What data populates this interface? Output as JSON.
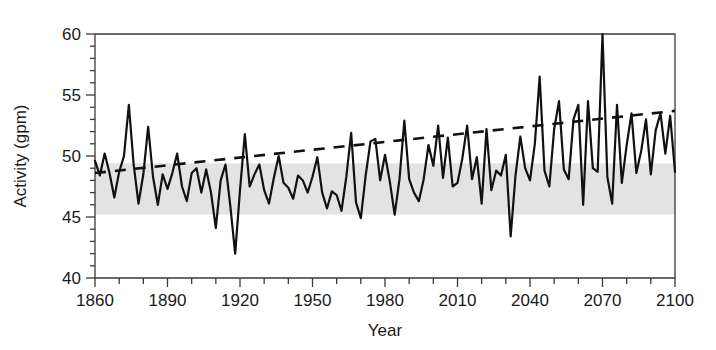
{
  "chart_data": {
    "type": "line",
    "title": "",
    "xlabel": "Year",
    "ylabel": "Activity (gpm)",
    "xlim": [
      1860,
      2100
    ],
    "ylim": [
      40,
      60
    ],
    "xticks": [
      1860,
      1890,
      1920,
      1950,
      1980,
      2010,
      2040,
      2070,
      2100
    ],
    "xtick_labels": [
      "1860",
      "1890",
      "1920",
      "1950",
      "1980",
      "2010",
      "2040",
      "2070",
      "2100"
    ],
    "xminor_step": 10,
    "yticks": [
      40,
      45,
      50,
      55,
      60
    ],
    "ytick_labels": [
      "40",
      "45",
      "50",
      "55",
      "60"
    ],
    "yminor_step": 1,
    "grid": false,
    "legend": "none",
    "line_color": "#111111",
    "band_color": "#e3e3e3",
    "trend_color": "#111111",
    "shaded_band": {
      "label": "reference envelope",
      "ymin": 45.2,
      "ymax": 49.4,
      "xmin": 1860,
      "xmax": 2100
    },
    "trend_line": {
      "label": "linear trend (dashed)",
      "style": "dashed",
      "x": [
        1860,
        2100
      ],
      "y": [
        48.6,
        53.7
      ]
    },
    "series": [
      {
        "name": "Activity",
        "x": [
          1860,
          1862,
          1864,
          1866,
          1868,
          1870,
          1872,
          1874,
          1876,
          1878,
          1880,
          1882,
          1884,
          1886,
          1888,
          1890,
          1892,
          1894,
          1896,
          1898,
          1900,
          1902,
          1904,
          1906,
          1908,
          1910,
          1912,
          1914,
          1916,
          1918,
          1920,
          1922,
          1924,
          1926,
          1928,
          1930,
          1932,
          1934,
          1936,
          1938,
          1940,
          1942,
          1944,
          1946,
          1948,
          1950,
          1952,
          1954,
          1956,
          1958,
          1960,
          1962,
          1964,
          1966,
          1968,
          1970,
          1972,
          1974,
          1976,
          1978,
          1980,
          1982,
          1984,
          1986,
          1988,
          1990,
          1992,
          1994,
          1996,
          1998,
          2000,
          2002,
          2004,
          2006,
          2008,
          2010,
          2012,
          2014,
          2016,
          2018,
          2020,
          2022,
          2024,
          2026,
          2028,
          2030,
          2032,
          2034,
          2036,
          2038,
          2040,
          2042,
          2044,
          2046,
          2048,
          2050,
          2052,
          2054,
          2056,
          2058,
          2060,
          2062,
          2064,
          2066,
          2068,
          2070,
          2072,
          2074,
          2076,
          2078,
          2080,
          2082,
          2084,
          2086,
          2088,
          2090,
          2092,
          2094,
          2096,
          2098,
          2100
        ],
        "y": [
          49.6,
          48.4,
          50.2,
          48.6,
          46.6,
          48.7,
          50.0,
          54.2,
          49.3,
          46.1,
          48.5,
          52.4,
          48.3,
          46.0,
          48.5,
          47.3,
          48.6,
          50.2,
          47.5,
          46.3,
          48.6,
          49.0,
          47.0,
          48.9,
          47.0,
          44.1,
          48.0,
          49.3,
          45.9,
          42.0,
          47.2,
          51.8,
          47.5,
          48.5,
          49.3,
          47.2,
          46.1,
          48.2,
          50.0,
          47.8,
          47.4,
          46.5,
          48.4,
          48.0,
          47.0,
          48.3,
          49.9,
          47.0,
          45.7,
          47.1,
          46.8,
          45.5,
          48.3,
          51.9,
          46.2,
          44.9,
          48.4,
          51.2,
          51.4,
          48.0,
          50.1,
          47.9,
          45.2,
          48.1,
          52.9,
          48.1,
          47.0,
          46.3,
          48.1,
          50.9,
          49.2,
          52.5,
          48.2,
          51.5,
          47.5,
          47.8,
          49.8,
          52.5,
          48.1,
          49.9,
          46.1,
          52.2,
          47.2,
          48.8,
          48.4,
          50.1,
          43.4,
          48.4,
          51.6,
          49.0,
          48.0,
          51.0,
          56.5,
          48.8,
          47.5,
          52.2,
          54.5,
          48.9,
          48.1,
          53.0,
          54.2,
          46.0,
          54.5,
          49.0,
          48.7,
          60.0,
          48.3,
          46.1,
          54.2,
          47.8,
          50.9,
          53.5,
          48.6,
          50.4,
          53.0,
          48.5,
          52.1,
          53.5,
          50.2,
          53.3,
          48.7
        ]
      }
    ],
    "annotations": {
      "max_value": 60.0,
      "max_year": 2070,
      "min_value": 42.0,
      "min_year": 1918
    }
  }
}
